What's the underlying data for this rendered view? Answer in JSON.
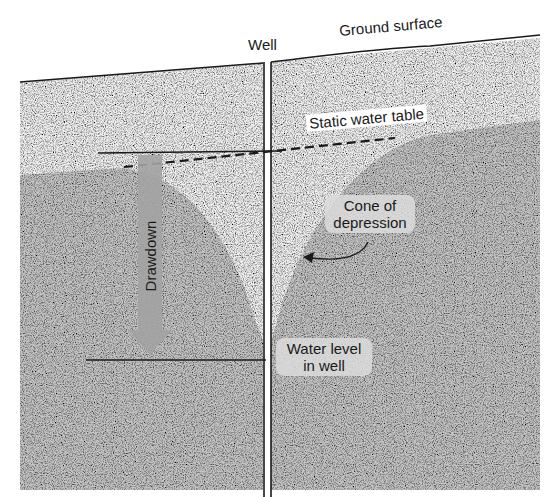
{
  "diagram": {
    "type": "cross-section",
    "labels": {
      "well": "Well",
      "ground_surface": "Ground surface",
      "static_water_table": "Static water table",
      "cone_of_depression_line1": "Cone of",
      "cone_of_depression_line2": "depression",
      "drawdown": "Drawdown",
      "water_level_line1": "Water level",
      "water_level_line2": "in well"
    },
    "colors": {
      "unsaturated_zone": "#eeeeee",
      "saturated_zone": "#c4c4c4",
      "drawdown_arrow": "#a0a0a0",
      "lines": "#1a1a1a",
      "label_background": "#dcdcdc"
    }
  }
}
